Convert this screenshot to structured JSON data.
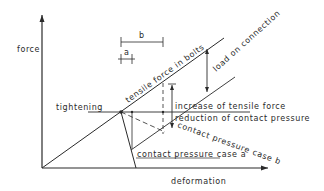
{
  "diagram": {
    "axes": {
      "y_label": "force",
      "x_label": "deformation"
    },
    "dimensions": {
      "a_label": "a",
      "b_label": "b"
    },
    "lines": {
      "tensile": "tensile force in bolts",
      "load": "load on connection",
      "tightening": "tightening",
      "increase": "increase of tensile force",
      "reduction": "reduction of contact pressure",
      "case_b": "contact pressure case b",
      "case_a": "contact pressure case a"
    },
    "colors": {
      "ink": "#2a2a2a",
      "background": "#ffffff"
    }
  }
}
